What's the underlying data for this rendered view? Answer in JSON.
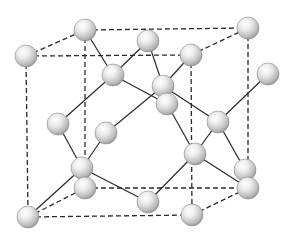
{
  "colors": {
    "background": "#ffffff",
    "line": "#2a2a2a",
    "atom_light": "#f4f4f4",
    "atom_dark": "#9a9a9a"
  },
  "atom_radius": 11,
  "atoms": [
    {
      "id": "front-top-left",
      "x": 26,
      "y": 56
    },
    {
      "id": "back-top-left",
      "x": 85,
      "y": 30
    },
    {
      "id": "back-top-right",
      "x": 248,
      "y": 28
    },
    {
      "id": "front-top-right",
      "x": 191,
      "y": 55
    },
    {
      "id": "top-face-center",
      "x": 148,
      "y": 41
    },
    {
      "id": "inner-upper-left",
      "x": 113,
      "y": 75
    },
    {
      "id": "inner-center-a",
      "x": 163,
      "y": 86
    },
    {
      "id": "inner-center-b",
      "x": 167,
      "y": 104
    },
    {
      "id": "right-face-center",
      "x": 268,
      "y": 74
    },
    {
      "id": "inner-upper-right",
      "x": 218,
      "y": 122
    },
    {
      "id": "left-face-center",
      "x": 58,
      "y": 124
    },
    {
      "id": "inner-mid-left",
      "x": 106,
      "y": 133
    },
    {
      "id": "inner-lower-left",
      "x": 82,
      "y": 168
    },
    {
      "id": "back-bottom-left",
      "x": 85,
      "y": 188
    },
    {
      "id": "front-face-center",
      "x": 195,
      "y": 154
    },
    {
      "id": "inner-lower-right",
      "x": 245,
      "y": 170
    },
    {
      "id": "back-bottom-right",
      "x": 248,
      "y": 188
    },
    {
      "id": "bottom-face-center",
      "x": 148,
      "y": 202
    },
    {
      "id": "front-bottom-left",
      "x": 28,
      "y": 217
    },
    {
      "id": "front-bottom-right",
      "x": 192,
      "y": 215
    }
  ],
  "cube_edges": [
    [
      26,
      56,
      191,
      55
    ],
    [
      85,
      30,
      248,
      28
    ],
    [
      26,
      56,
      85,
      30
    ],
    [
      191,
      55,
      248,
      28
    ],
    [
      26,
      56,
      28,
      217
    ],
    [
      85,
      30,
      85,
      188
    ],
    [
      248,
      28,
      248,
      188
    ],
    [
      191,
      55,
      192,
      215
    ],
    [
      28,
      217,
      192,
      215
    ],
    [
      85,
      188,
      248,
      188
    ],
    [
      28,
      217,
      85,
      188
    ],
    [
      192,
      215,
      248,
      188
    ]
  ],
  "bonds": [
    [
      85,
      30,
      113,
      75
    ],
    [
      148,
      41,
      113,
      75
    ],
    [
      113,
      75,
      58,
      124
    ],
    [
      113,
      75,
      167,
      104
    ],
    [
      163,
      86,
      148,
      41
    ],
    [
      163,
      86,
      191,
      55
    ],
    [
      163,
      86,
      106,
      133
    ],
    [
      163,
      86,
      218,
      122
    ],
    [
      167,
      104,
      195,
      154
    ],
    [
      218,
      122,
      268,
      74
    ],
    [
      218,
      122,
      245,
      170
    ],
    [
      218,
      122,
      195,
      154
    ],
    [
      58,
      124,
      82,
      168
    ],
    [
      106,
      133,
      82,
      168
    ],
    [
      82,
      168,
      28,
      217
    ],
    [
      82,
      168,
      148,
      202
    ],
    [
      195,
      154,
      148,
      202
    ],
    [
      195,
      154,
      248,
      188
    ]
  ]
}
